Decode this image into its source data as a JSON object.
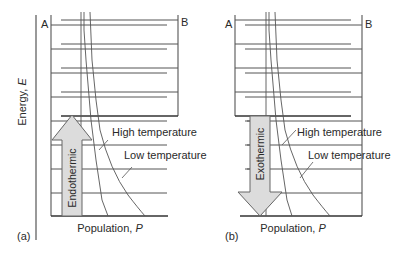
{
  "figure": {
    "axis_label": "Energy, E",
    "axis_label_main": "Energy, ",
    "axis_label_var": "E",
    "colors": {
      "line": "#555555",
      "dark_line": "#333333",
      "arrow_fill": "#dcdcdc",
      "arrow_stroke": "#666666",
      "text": "#2a2a2a"
    }
  },
  "panels": [
    {
      "id": "a",
      "panel_label": "(a)",
      "left_label": "A",
      "right_label": "B",
      "xlabel_main": "Population, ",
      "xlabel_var": "P",
      "arrow_label": "Endothermic",
      "arrow_direction": "up",
      "curve_labels": {
        "high": "High temperature",
        "low": "Low temperature"
      }
    },
    {
      "id": "b",
      "panel_label": "(b)",
      "left_label": "A",
      "right_label": "B",
      "xlabel_main": "Population, ",
      "xlabel_var": "P",
      "arrow_label": "Exothermic",
      "arrow_direction": "down",
      "curve_labels": {
        "high": "High temperature",
        "low": "Low temperature"
      }
    }
  ]
}
